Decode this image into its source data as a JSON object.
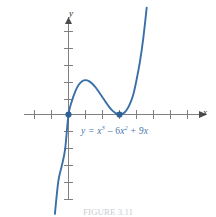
{
  "figure": {
    "equation_label": {
      "lhs": "y =",
      "term1_base": "x",
      "term1_exp": "3",
      "op1": "–",
      "term2_coef": "6",
      "term2_base": "x",
      "term2_exp": "2",
      "op2": "+",
      "term3": "9x"
    },
    "x_axis_label": "x",
    "y_axis_label": "y",
    "caption": "FIGURE 3.11"
  },
  "colors": {
    "curve": "#3a6fa8",
    "point": "#2e5f96",
    "axis": "#808080",
    "tick": "#808080",
    "equation_text": "#4a77ab",
    "axis_label_text": "#2d2d2d",
    "background": "#ffffff"
  },
  "chart_data": {
    "type": "line",
    "title": "",
    "subtitle": "",
    "xlabel": "x",
    "ylabel": "y",
    "equation": "y = x^3 - 6x^2 + 9x",
    "grid": false,
    "legend": "none",
    "annotations": [
      {
        "text": "y = x³ – 6x² + 9x",
        "x": 0.8,
        "y": -1.2
      }
    ],
    "xlim": [
      -2.1,
      6.2
    ],
    "ylim": [
      -9.5,
      7.0
    ],
    "xticks": [
      -2,
      -1,
      0,
      1,
      2,
      3,
      4,
      5,
      6
    ],
    "yticks": [
      -8,
      -7,
      -6,
      -5,
      -4,
      -3,
      -2,
      -1,
      0,
      1,
      2,
      3,
      4,
      5
    ],
    "xticklabels": [],
    "yticklabels": [],
    "marked_points": [
      {
        "label": "root / local max x-intercept",
        "x": 0,
        "y": 0
      },
      {
        "label": "local minimum",
        "x": 3,
        "y": 0
      }
    ],
    "critical_points": [
      {
        "kind": "local maximum",
        "x": 1,
        "y": 4
      },
      {
        "kind": "local minimum",
        "x": 3,
        "y": 0
      }
    ],
    "series": [
      {
        "name": "y = x^3 - 6x^2 + 9x",
        "x": [
          -1.35,
          -1.2,
          -1.0,
          -0.8,
          -0.6,
          -0.4,
          -0.2,
          0.0,
          0.2,
          0.4,
          0.6,
          0.8,
          1.0,
          1.2,
          1.4,
          1.6,
          1.8,
          2.0,
          2.2,
          2.4,
          2.6,
          2.8,
          3.0,
          3.2,
          3.4,
          3.6,
          3.8,
          4.0,
          4.2,
          4.4,
          4.6,
          4.8,
          5.0
        ],
        "y": [
          -25.5,
          -21.17,
          -16.0,
          -11.55,
          -7.78,
          -6.0,
          -4.05,
          0.0,
          1.57,
          2.7,
          3.46,
          3.87,
          4.0,
          3.89,
          3.58,
          3.14,
          2.59,
          2.0,
          1.41,
          0.86,
          0.42,
          0.13,
          0.0,
          0.1,
          0.46,
          1.18,
          2.23,
          4.0,
          6.11,
          8.89,
          12.42,
          16.99,
          20.0
        ]
      }
    ]
  }
}
